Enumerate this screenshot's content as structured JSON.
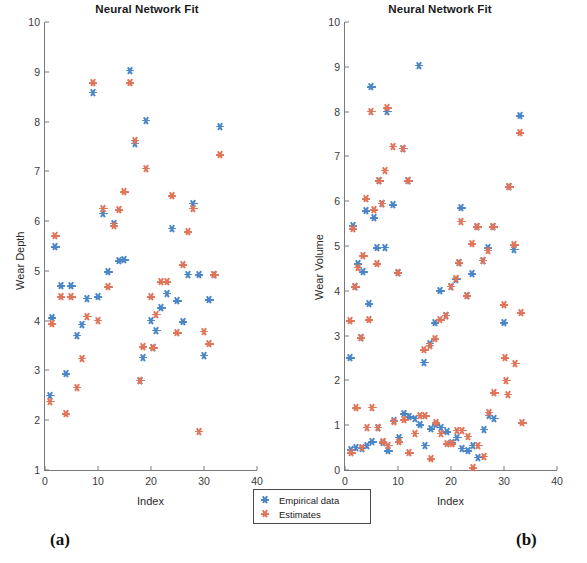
{
  "figure": {
    "caption_a": "(a)",
    "caption_b": "(b)"
  },
  "legend": {
    "empirical_label": "Empirical data",
    "estimates_label": "Estimates",
    "empirical_color": "#4a86c8",
    "estimates_color": "#e0755a"
  },
  "chart_data": [
    {
      "panel": "(a)",
      "type": "scatter",
      "title": "Neural Network Fit",
      "xlabel": "Index",
      "ylabel": "Wear Depth",
      "xlim": [
        0,
        40
      ],
      "ylim": [
        1,
        10
      ],
      "xticks": [
        0,
        10,
        20,
        30,
        40
      ],
      "yticks": [
        1,
        2,
        3,
        4,
        5,
        6,
        7,
        8,
        9,
        10
      ],
      "grid": false,
      "legend_position": "below-right",
      "series": [
        {
          "name": "Empirical data",
          "color": "#4a86c8",
          "points": [
            [
              1.0,
              2.5
            ],
            [
              1.3,
              4.05
            ],
            [
              2.0,
              5.48
            ],
            [
              3.0,
              4.7
            ],
            [
              4.0,
              2.93
            ],
            [
              5.0,
              4.7
            ],
            [
              6.0,
              3.7
            ],
            [
              7.0,
              3.92
            ],
            [
              8.0,
              4.45
            ],
            [
              9.0,
              8.58
            ],
            [
              10.0,
              4.48
            ],
            [
              11.0,
              6.15
            ],
            [
              12.0,
              4.98
            ],
            [
              13.0,
              5.95
            ],
            [
              14.0,
              5.2
            ],
            [
              15.0,
              5.22
            ],
            [
              16.0,
              9.03
            ],
            [
              17.0,
              7.56
            ],
            [
              18.0,
              2.8
            ],
            [
              18.5,
              3.26
            ],
            [
              19.0,
              8.02
            ],
            [
              20.0,
              4.0
            ],
            [
              20.5,
              3.45
            ],
            [
              21.0,
              3.8
            ],
            [
              22.0,
              4.25
            ],
            [
              23.0,
              4.55
            ],
            [
              24.0,
              5.85
            ],
            [
              25.0,
              4.4
            ],
            [
              26.0,
              3.97
            ],
            [
              27.0,
              4.93
            ],
            [
              28.0,
              6.35
            ],
            [
              29.0,
              4.92
            ],
            [
              30.0,
              3.3
            ],
            [
              31.0,
              4.42
            ],
            [
              32.0,
              4.92
            ],
            [
              33.0,
              7.9
            ]
          ]
        },
        {
          "name": "Estimates",
          "color": "#e0755a",
          "points": [
            [
              1.0,
              2.38
            ],
            [
              1.3,
              3.93
            ],
            [
              2.0,
              5.7
            ],
            [
              3.0,
              4.48
            ],
            [
              4.0,
              2.12
            ],
            [
              5.0,
              4.48
            ],
            [
              6.0,
              2.66
            ],
            [
              7.0,
              3.24
            ],
            [
              8.0,
              4.08
            ],
            [
              9.0,
              8.77
            ],
            [
              10.0,
              4.0
            ],
            [
              11.0,
              6.25
            ],
            [
              12.0,
              4.68
            ],
            [
              13.0,
              5.9
            ],
            [
              14.0,
              6.22
            ],
            [
              15.0,
              6.58
            ],
            [
              16.0,
              8.77
            ],
            [
              17.0,
              7.62
            ],
            [
              18.0,
              2.8
            ],
            [
              18.5,
              3.47
            ],
            [
              19.0,
              7.06
            ],
            [
              20.0,
              4.48
            ],
            [
              20.5,
              3.45
            ],
            [
              21.0,
              4.12
            ],
            [
              22.0,
              4.78
            ],
            [
              23.0,
              4.78
            ],
            [
              24.0,
              6.5
            ],
            [
              25.0,
              3.75
            ],
            [
              26.0,
              5.12
            ],
            [
              27.0,
              5.78
            ],
            [
              28.0,
              6.25
            ],
            [
              29.0,
              1.77
            ],
            [
              30.0,
              3.78
            ],
            [
              31.0,
              3.53
            ],
            [
              32.0,
              4.92
            ],
            [
              33.0,
              7.33
            ]
          ]
        }
      ]
    },
    {
      "panel": "(b)",
      "type": "scatter",
      "title": "Neural Network Fit",
      "xlabel": "Index",
      "ylabel": "Wear Volume",
      "xlim": [
        0,
        40
      ],
      "ylim": [
        0,
        10
      ],
      "xticks": [
        0,
        10,
        20,
        30,
        40
      ],
      "yticks": [
        0,
        1,
        2,
        3,
        4,
        5,
        6,
        7,
        8,
        9,
        10
      ],
      "grid": false,
      "legend_position": "below-left",
      "series": [
        {
          "name": "Empirical data",
          "color": "#4a86c8",
          "points": [
            [
              1.0,
              2.5
            ],
            [
              1.5,
              5.45
            ],
            [
              2.0,
              4.08
            ],
            [
              2.5,
              4.6
            ],
            [
              3.0,
              2.95
            ],
            [
              3.5,
              4.42
            ],
            [
              4.0,
              5.78
            ],
            [
              4.5,
              3.7
            ],
            [
              5.0,
              8.55
            ],
            [
              5.5,
              5.62
            ],
            [
              6.0,
              4.95
            ],
            [
              6.5,
              6.45
            ],
            [
              7.0,
              5.95
            ],
            [
              7.5,
              4.97
            ],
            [
              8.0,
              8.0
            ],
            [
              9.0,
              5.92
            ],
            [
              10.0,
              4.4
            ],
            [
              11.0,
              7.18
            ],
            [
              12.0,
              6.45
            ],
            [
              14.0,
              9.03
            ],
            [
              15.0,
              2.4
            ],
            [
              16.0,
              2.82
            ],
            [
              17.0,
              3.28
            ],
            [
              18.0,
              4.0
            ],
            [
              19.0,
              3.45
            ],
            [
              20.0,
              4.1
            ],
            [
              21.0,
              4.25
            ],
            [
              21.5,
              4.62
            ],
            [
              22.0,
              5.85
            ],
            [
              23.0,
              3.9
            ],
            [
              24.0,
              4.38
            ],
            [
              25.0,
              5.42
            ],
            [
              26.0,
              4.68
            ],
            [
              27.0,
              4.95
            ],
            [
              28.0,
              5.42
            ],
            [
              30.0,
              3.28
            ],
            [
              31.0,
              6.32
            ],
            [
              32.0,
              4.92
            ],
            [
              33.0,
              7.9
            ],
            [
              1.2,
              0.45
            ],
            [
              2.2,
              0.5
            ],
            [
              3.2,
              0.48
            ],
            [
              4.2,
              0.55
            ],
            [
              5.2,
              0.62
            ],
            [
              6.2,
              0.95
            ],
            [
              7.2,
              0.6
            ],
            [
              8.2,
              0.42
            ],
            [
              9.2,
              1.1
            ],
            [
              10.2,
              0.72
            ],
            [
              11.2,
              1.25
            ],
            [
              12.2,
              1.18
            ],
            [
              13.2,
              1.15
            ],
            [
              14.2,
              1.0
            ],
            [
              15.2,
              0.55
            ],
            [
              16.2,
              0.92
            ],
            [
              17.2,
              1.0
            ],
            [
              18.2,
              0.95
            ],
            [
              19.2,
              0.85
            ],
            [
              20.2,
              0.6
            ],
            [
              21.2,
              0.72
            ],
            [
              22.2,
              0.48
            ],
            [
              23.2,
              0.42
            ],
            [
              24.2,
              0.55
            ],
            [
              25.2,
              0.28
            ],
            [
              26.2,
              0.9
            ],
            [
              27.2,
              1.22
            ],
            [
              28.2,
              1.15
            ]
          ]
        },
        {
          "name": "Estimates",
          "color": "#e0755a",
          "points": [
            [
              1.0,
              3.33
            ],
            [
              1.5,
              5.38
            ],
            [
              2.0,
              4.08
            ],
            [
              2.5,
              4.52
            ],
            [
              3.0,
              2.95
            ],
            [
              3.5,
              4.78
            ],
            [
              4.0,
              6.05
            ],
            [
              4.5,
              3.35
            ],
            [
              5.0,
              8.0
            ],
            [
              5.5,
              5.8
            ],
            [
              6.0,
              4.6
            ],
            [
              6.5,
              6.45
            ],
            [
              7.0,
              5.95
            ],
            [
              7.5,
              6.68
            ],
            [
              8.0,
              8.08
            ],
            [
              9.0,
              7.22
            ],
            [
              10.0,
              4.4
            ],
            [
              11.0,
              7.18
            ],
            [
              12.0,
              6.45
            ],
            [
              15.0,
              2.68
            ],
            [
              16.0,
              2.78
            ],
            [
              17.0,
              2.92
            ],
            [
              18.0,
              3.35
            ],
            [
              19.0,
              3.45
            ],
            [
              20.0,
              4.1
            ],
            [
              21.0,
              4.28
            ],
            [
              21.5,
              4.62
            ],
            [
              22.0,
              5.55
            ],
            [
              23.0,
              3.88
            ],
            [
              24.0,
              5.05
            ],
            [
              25.0,
              5.42
            ],
            [
              26.0,
              4.68
            ],
            [
              27.0,
              4.9
            ],
            [
              28.0,
              5.42
            ],
            [
              30.0,
              3.68
            ],
            [
              31.0,
              6.32
            ],
            [
              32.0,
              5.02
            ],
            [
              33.0,
              7.52
            ],
            [
              1.2,
              0.38
            ],
            [
              2.2,
              1.38
            ],
            [
              3.2,
              0.5
            ],
            [
              4.2,
              0.95
            ],
            [
              5.2,
              1.4
            ],
            [
              6.2,
              0.95
            ],
            [
              7.2,
              0.62
            ],
            [
              8.2,
              0.55
            ],
            [
              9.2,
              1.08
            ],
            [
              10.2,
              0.62
            ],
            [
              11.2,
              1.12
            ],
            [
              12.2,
              0.38
            ],
            [
              13.2,
              0.82
            ],
            [
              14.2,
              1.22
            ],
            [
              15.2,
              1.2
            ],
            [
              16.2,
              0.25
            ],
            [
              17.2,
              1.05
            ],
            [
              18.2,
              0.82
            ],
            [
              19.2,
              0.58
            ],
            [
              20.2,
              0.58
            ],
            [
              21.2,
              0.88
            ],
            [
              22.2,
              0.88
            ],
            [
              23.2,
              0.75
            ],
            [
              24.2,
              0.05
            ],
            [
              25.2,
              0.55
            ],
            [
              26.2,
              0.3
            ],
            [
              27.2,
              1.28
            ],
            [
              28.2,
              1.72
            ],
            [
              30.2,
              2.5
            ],
            [
              30.5,
              2.0
            ],
            [
              30.8,
              1.68
            ],
            [
              32.2,
              2.38
            ],
            [
              33.2,
              3.5
            ],
            [
              33.5,
              1.05
            ]
          ]
        }
      ]
    }
  ]
}
